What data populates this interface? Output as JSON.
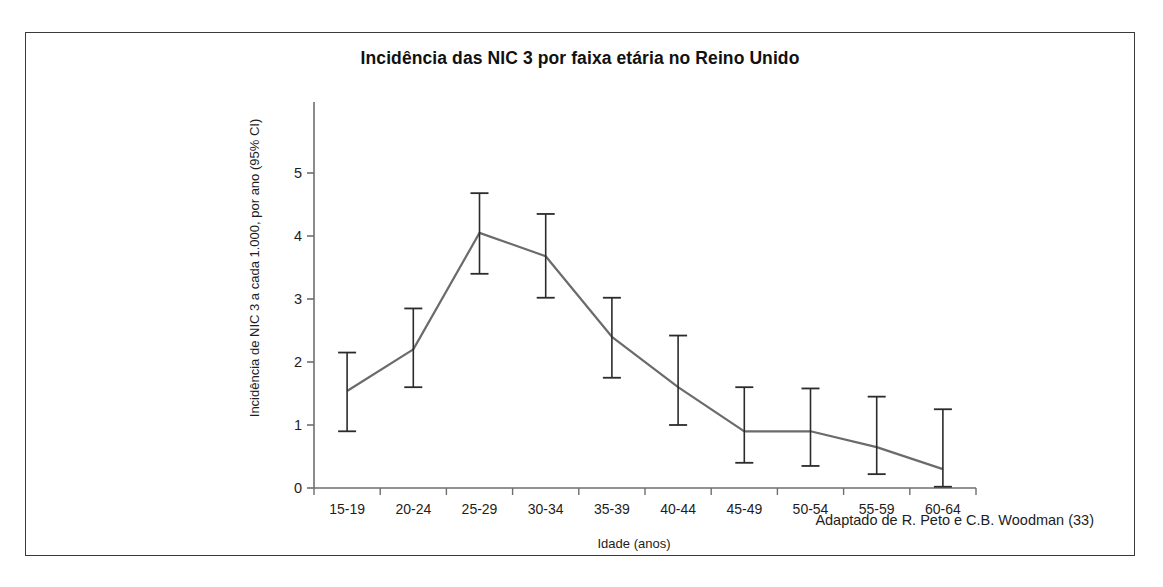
{
  "chart_data": {
    "type": "line",
    "title": "Incidência das NIC 3 por faixa etária no Reino Unido",
    "xlabel": "Idade (anos)",
    "ylabel": "Incidência de NIC 3 a cada 1.000, por ano (95% CI)",
    "categories": [
      "15-19",
      "20-24",
      "25-29",
      "30-34",
      "35-39",
      "40-44",
      "45-49",
      "50-54",
      "55-59",
      "60-64"
    ],
    "values": [
      1.54,
      2.2,
      4.05,
      3.68,
      2.4,
      1.6,
      0.9,
      0.9,
      0.65,
      0.3
    ],
    "error_low": [
      0.9,
      1.6,
      3.4,
      3.02,
      1.75,
      1.0,
      0.4,
      0.35,
      0.22,
      0.02
    ],
    "error_high": [
      2.15,
      2.85,
      4.68,
      4.35,
      3.02,
      2.42,
      1.6,
      1.58,
      1.45,
      1.25
    ],
    "ylim": [
      0,
      6.0
    ],
    "yticks": [
      0,
      1,
      2,
      3,
      4,
      5
    ],
    "ytick_labels": [
      "0",
      "1",
      "2",
      "3",
      "4",
      "5"
    ],
    "grid": false,
    "legend": "none",
    "series_color": "#6b6b6b",
    "axis_color": "#6e6e6e",
    "error_bar_color": "#2b2b2b",
    "annotations": [
      "Adaptado de R. Peto e C.B. Woodman (33)"
    ]
  },
  "figure": {
    "source_note": "Adaptado de R. Peto e C.B. Woodman (33)",
    "frame_color": "#3a3a3a",
    "background": "#ffffff"
  }
}
